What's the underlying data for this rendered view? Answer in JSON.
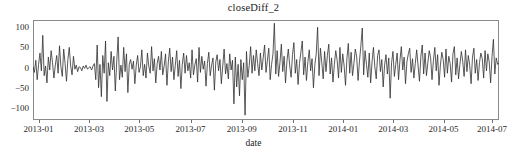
{
  "chart_data": {
    "type": "line",
    "title": "closeDiff_2",
    "xlabel": "date",
    "ylabel": "",
    "grid": false,
    "legend": false,
    "ylim": [
      -130,
      118
    ],
    "yticks": [
      100,
      50,
      0,
      -50,
      -100
    ],
    "ytick_labels": [
      "100",
      "50",
      "0",
      "-50",
      "-100"
    ],
    "xlim": [
      "2013-01",
      "2014-08"
    ],
    "xticks": [
      "2013-01",
      "2013-03",
      "2013-05",
      "2013-07",
      "2013-09",
      "2013-11",
      "2014-01",
      "2014-03",
      "2014-05",
      "2014-07"
    ],
    "xtick_positions": [
      0.012,
      0.12,
      0.228,
      0.338,
      0.448,
      0.558,
      0.666,
      0.773,
      0.881,
      0.985
    ],
    "line_color": "#303030",
    "line_width": 0.8,
    "series": [
      {
        "name": "closeDiff_2",
        "values": [
          2,
          -12,
          18,
          -30,
          8,
          36,
          -8,
          80,
          -20,
          4,
          -38,
          26,
          -6,
          42,
          12,
          -26,
          6,
          30,
          -14,
          54,
          2,
          -22,
          46,
          10,
          -34,
          20,
          50,
          4,
          -18,
          28,
          -4,
          6,
          -10,
          2,
          0,
          -8,
          4,
          -2,
          6,
          -4,
          0,
          2,
          -6,
          4,
          10,
          -30,
          56,
          -50,
          8,
          -72,
          30,
          -14,
          66,
          -84,
          12,
          -20,
          40,
          -6,
          28,
          -58,
          14,
          76,
          -30,
          6,
          -24,
          50,
          -10,
          34,
          -62,
          8,
          20,
          -4,
          16,
          -40,
          6,
          30,
          -12,
          2,
          44,
          -20,
          8,
          -26,
          36,
          4,
          -14,
          52,
          -8,
          22,
          -38,
          10,
          28,
          -6,
          40,
          -18,
          4,
          34,
          -44,
          14,
          48,
          -10,
          26,
          -30,
          6,
          42,
          -22,
          18,
          -52,
          8,
          36,
          -14,
          30,
          -8,
          12,
          -26,
          44,
          -18,
          6,
          22,
          -36,
          50,
          -12,
          28,
          -4,
          16,
          -46,
          10,
          38,
          -20,
          6,
          24,
          -56,
          14,
          32,
          -8,
          20,
          -40,
          4,
          46,
          -16,
          10,
          -28,
          34,
          -6,
          18,
          -90,
          26,
          -48,
          8,
          -70,
          20,
          -30,
          12,
          -118,
          40,
          -24,
          6,
          52,
          -14,
          30,
          -8,
          44,
          10,
          -20,
          36,
          -6,
          24,
          56,
          -12,
          18,
          48,
          -30,
          8,
          34,
          110,
          -16,
          42,
          -22,
          12,
          58,
          -10,
          28,
          -38,
          16,
          46,
          4,
          -24,
          32,
          62,
          -14,
          20,
          -42,
          10,
          38,
          66,
          -18,
          26,
          -32,
          14,
          44,
          -8,
          22,
          -50,
          6,
          34,
          100,
          -20,
          48,
          12,
          -28,
          40,
          -10,
          30,
          58,
          -16,
          24,
          -36,
          8,
          42,
          18,
          -26,
          50,
          -12,
          34,
          4,
          -44,
          22,
          60,
          -14,
          38,
          -20,
          10,
          46,
          26,
          -32,
          16,
          54,
          98,
          -18,
          42,
          8,
          -24,
          36,
          -38,
          14,
          50,
          2,
          -28,
          30,
          44,
          -10,
          20,
          -48,
          6,
          32,
          -16,
          24,
          -76,
          12,
          40,
          -22,
          8,
          36,
          -30,
          18,
          52,
          -6,
          26,
          -40,
          14,
          34,
          48,
          -12,
          22,
          -26,
          10,
          44,
          4,
          -34,
          28,
          56,
          -16,
          36,
          -20,
          12,
          42,
          24,
          -30,
          18,
          50,
          -8,
          32,
          -44,
          6,
          38,
          20,
          -24,
          46,
          -14,
          28,
          10,
          -36,
          34,
          52,
          -18,
          24,
          -28,
          8,
          40,
          16,
          -22,
          44,
          -10,
          30,
          6,
          -40,
          26,
          48,
          -14,
          20,
          -32,
          12,
          36,
          22,
          -26,
          42,
          -8,
          34,
          14,
          -38,
          28,
          70,
          -16,
          24,
          8,
          12
        ]
      }
    ]
  },
  "axes": {
    "title_text": "closeDiff_2",
    "x_label_text": "date"
  }
}
